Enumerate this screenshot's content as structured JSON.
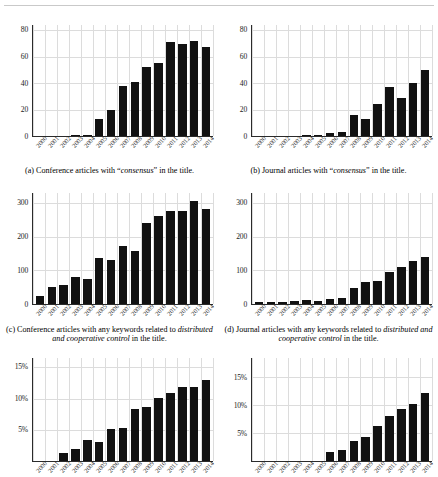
{
  "figure": {
    "panel_count": 6,
    "x_categories": [
      "2000",
      "2001",
      "2002",
      "2003",
      "2004",
      "2005",
      "2006",
      "2007",
      "2008",
      "2009",
      "2010",
      "2011",
      "2012",
      "2013",
      "2014"
    ]
  },
  "panels": [
    {
      "id": "a",
      "caption_label": "(a)",
      "caption_pre": " Conference articles with “",
      "caption_em": "consensus",
      "caption_post": "” in the title.",
      "caption_full": "(a) Conference articles with “consensus” in the title.",
      "yticks": [
        "0",
        "20",
        "40",
        "60",
        "80"
      ]
    },
    {
      "id": "b",
      "caption_label": "(b)",
      "caption_pre": " Journal articles with “",
      "caption_em": "consensus",
      "caption_post": "” in the title.",
      "caption_full": "(b) Journal articles with “consensus” in the title.",
      "yticks": [
        "0",
        "20",
        "40",
        "60",
        "80"
      ]
    },
    {
      "id": "c",
      "caption_label": "(c)",
      "caption_pre": " Conference articles with any keywords related to ",
      "caption_em": "distributed and cooperative control",
      "caption_post": " in the title.",
      "caption_full": "(c) Conference articles with any keywords related to distributed and cooperative control in the title.",
      "yticks": [
        "0",
        "100",
        "200",
        "300"
      ]
    },
    {
      "id": "d",
      "caption_label": "(d)",
      "caption_pre": " Journal articles with any keywords related to ",
      "caption_em": "distributed and cooperative control",
      "caption_post": " in the title.",
      "caption_full": "(d) Journal articles with any keywords related to distributed and cooperative control in the title.",
      "yticks": [
        "0",
        "100",
        "200",
        "300"
      ]
    },
    {
      "id": "e",
      "caption_label": "(e)",
      "caption_pre": "",
      "caption_em": "",
      "caption_post": "",
      "caption_full": "",
      "yticks": [
        "5%",
        "10%",
        "15%"
      ]
    },
    {
      "id": "f",
      "caption_label": "(f)",
      "caption_pre": "",
      "caption_em": "",
      "caption_post": "",
      "caption_full": "",
      "yticks": [
        "5%",
        "10%",
        "15%"
      ]
    }
  ],
  "chart_data": [
    {
      "type": "bar",
      "panel": "a",
      "title": "(a) Conference articles with “consensus” in the title.",
      "xlabel": "",
      "ylabel": "",
      "grid": true,
      "ylim": [
        0,
        84
      ],
      "yticks": [
        0,
        20,
        40,
        60,
        80
      ],
      "categories": [
        "2000",
        "2001",
        "2002",
        "2003",
        "2004",
        "2005",
        "2006",
        "2007",
        "2008",
        "2009",
        "2010",
        "2011",
        "2012",
        "2013",
        "2014"
      ],
      "values": [
        0,
        0,
        0,
        1,
        1,
        13,
        20,
        38,
        41,
        52,
        55,
        71,
        70,
        72,
        67
      ]
    },
    {
      "type": "bar",
      "panel": "b",
      "title": "(b) Journal articles with “consensus” in the title.",
      "xlabel": "",
      "ylabel": "",
      "grid": true,
      "ylim": [
        0,
        84
      ],
      "yticks": [
        0,
        20,
        40,
        60,
        80
      ],
      "categories": [
        "2000",
        "2001",
        "2002",
        "2003",
        "2004",
        "2005",
        "2006",
        "2007",
        "2008",
        "2009",
        "2010",
        "2011",
        "2012",
        "2013",
        "2014"
      ],
      "values": [
        0,
        0,
        0,
        0,
        1,
        1,
        2,
        3,
        16,
        13,
        24,
        37,
        29,
        40,
        50
      ]
    },
    {
      "type": "bar",
      "panel": "c",
      "title": "(c) Conference articles with any keywords related to distributed and cooperative control in the title.",
      "xlabel": "",
      "ylabel": "",
      "grid": true,
      "ylim": [
        0,
        330
      ],
      "yticks": [
        0,
        100,
        200,
        300
      ],
      "categories": [
        "2000",
        "2001",
        "2002",
        "2003",
        "2004",
        "2005",
        "2006",
        "2007",
        "2008",
        "2009",
        "2010",
        "2011",
        "2012",
        "2013",
        "2014"
      ],
      "values": [
        24,
        52,
        56,
        80,
        75,
        137,
        132,
        173,
        157,
        241,
        262,
        277,
        278,
        307,
        282
      ]
    },
    {
      "type": "bar",
      "panel": "d",
      "title": "(d) Journal articles with any keywords related to distributed and cooperative control in the title.",
      "xlabel": "",
      "ylabel": "",
      "grid": true,
      "ylim": [
        0,
        330
      ],
      "yticks": [
        0,
        100,
        200,
        300
      ],
      "categories": [
        "2000",
        "2001",
        "2002",
        "2003",
        "2004",
        "2005",
        "2006",
        "2007",
        "2008",
        "2009",
        "2010",
        "2011",
        "2012",
        "2013",
        "2014"
      ],
      "values": [
        6,
        5,
        7,
        8,
        11,
        10,
        15,
        19,
        49,
        65,
        68,
        95,
        109,
        127,
        139
      ]
    },
    {
      "type": "bar",
      "panel": "e",
      "title": "",
      "xlabel": "",
      "ylabel": "",
      "grid": true,
      "ylim": [
        0,
        16.5
      ],
      "yticks": [
        5,
        10,
        15
      ],
      "ytick_labels": [
        "5%",
        "10%",
        "15%"
      ],
      "categories": [
        "2000",
        "2001",
        "2002",
        "2003",
        "2004",
        "2005",
        "2006",
        "2007",
        "2008",
        "2009",
        "2010",
        "2011",
        "2012",
        "2013",
        "2014"
      ],
      "values": [
        0.0,
        0.0,
        1.3,
        1.9,
        3.3,
        3.1,
        5.1,
        5.3,
        8.4,
        8.7,
        10.1,
        10.9,
        11.9,
        11.8,
        12.9,
        13.7
      ]
    },
    {
      "type": "bar",
      "panel": "f",
      "title": "",
      "xlabel": "",
      "ylabel": "",
      "grid": true,
      "ylim": [
        0,
        18.5
      ],
      "yticks": [
        5,
        10,
        15
      ],
      "ytick_labels": [
        "5%",
        "10%",
        "15%"
      ],
      "categories": [
        "2000",
        "2001",
        "2002",
        "2003",
        "2004",
        "2005",
        "2006",
        "2007",
        "2008",
        "2009",
        "2010",
        "2011",
        "2012",
        "2013",
        "2014"
      ],
      "values": [
        0.0,
        0.0,
        0.0,
        0.0,
        0.0,
        0.0,
        1.6,
        2.0,
        3.6,
        4.4,
        6.3,
        8.1,
        9.4,
        10.3,
        12.2,
        13.6
      ]
    }
  ]
}
